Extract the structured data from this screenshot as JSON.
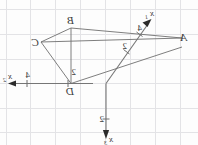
{
  "figure": {
    "name": "coordinate-axes-quadrilateral-figure",
    "background_color": "#fdfdfd",
    "grid_color": "#e3e3e6",
    "axis_color": "#767676",
    "edge_color": "#6f6f6f",
    "label_color": "#3a3a3a",
    "orientation_note": "mirrored"
  },
  "axes": [
    {
      "id": "x1",
      "label_base": "x",
      "label_sub": "1",
      "tick_label": "2",
      "tick_label_2": "4",
      "direction": "up-right-diagonal",
      "has_arrowhead": true
    },
    {
      "id": "x2",
      "label_base": "x",
      "label_sub": "2",
      "tick_label": "4",
      "tick_label_2": "2",
      "direction": "left-horizontal",
      "has_arrowhead": true
    },
    {
      "id": "x3",
      "label_base": "x",
      "label_sub": "3",
      "tick_label": "2",
      "direction": "down-vertical",
      "has_arrowhead": true
    }
  ],
  "vertices": [
    {
      "id": "A",
      "label": "A"
    },
    {
      "id": "B",
      "label": "B"
    },
    {
      "id": "C",
      "label": "C"
    },
    {
      "id": "D",
      "label": "D"
    }
  ],
  "tick_labels": {
    "x1_near": "2",
    "x1_far": "4",
    "x2_far": "4",
    "x2_near": "2",
    "x3_near": "2"
  }
}
